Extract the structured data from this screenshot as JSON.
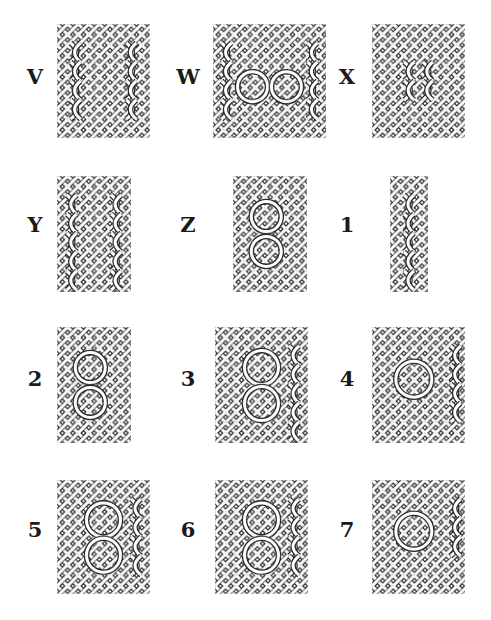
{
  "figure": {
    "ink_color": "#2a2a2a",
    "grid_color": "#c8c8c8",
    "background": "#ffffff"
  },
  "panels": [
    {
      "label": "V",
      "x": 57,
      "y": 24,
      "w": 93,
      "h": 114,
      "label_x": 35,
      "label_y": 76,
      "motif": "vertical-twists"
    },
    {
      "label": "W",
      "x": 213,
      "y": 24,
      "w": 113,
      "h": 114,
      "label_x": 188,
      "label_y": 76,
      "motif": "loop-columns"
    },
    {
      "label": "X",
      "x": 372,
      "y": 24,
      "w": 93,
      "h": 114,
      "label_x": 347,
      "label_y": 76,
      "motif": "center-twists"
    },
    {
      "label": "Y",
      "x": 57,
      "y": 176,
      "w": 74,
      "h": 116,
      "label_x": 35,
      "label_y": 224,
      "motif": "vertical-twists"
    },
    {
      "label": "Z",
      "x": 233,
      "y": 176,
      "w": 74,
      "h": 116,
      "label_x": 188,
      "label_y": 224,
      "motif": "stacked-loops"
    },
    {
      "label": "1",
      "x": 390,
      "y": 176,
      "w": 38,
      "h": 116,
      "label_x": 347,
      "label_y": 224,
      "motif": "narrow-twist"
    },
    {
      "label": "2",
      "x": 57,
      "y": 327,
      "w": 74,
      "h": 116,
      "label_x": 35,
      "label_y": 378,
      "motif": "stacked-loops"
    },
    {
      "label": "3",
      "x": 215,
      "y": 327,
      "w": 93,
      "h": 116,
      "label_x": 188,
      "label_y": 378,
      "motif": "stacked-loops-wide"
    },
    {
      "label": "4",
      "x": 372,
      "y": 327,
      "w": 93,
      "h": 116,
      "label_x": 347,
      "label_y": 378,
      "motif": "single-loop"
    },
    {
      "label": "5",
      "x": 57,
      "y": 480,
      "w": 93,
      "h": 114,
      "label_x": 35,
      "label_y": 529,
      "motif": "stacked-loops-wide"
    },
    {
      "label": "6",
      "x": 215,
      "y": 480,
      "w": 93,
      "h": 114,
      "label_x": 188,
      "label_y": 529,
      "motif": "stacked-loops-wide"
    },
    {
      "label": "7",
      "x": 372,
      "y": 480,
      "w": 93,
      "h": 114,
      "label_x": 347,
      "label_y": 529,
      "motif": "single-loop"
    }
  ]
}
